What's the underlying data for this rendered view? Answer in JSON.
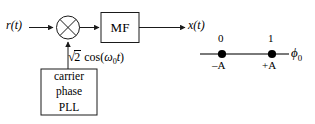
{
  "figure": {
    "type": "block-diagram"
  },
  "block_diagram": {
    "input_signal_label": "r(t)",
    "output_signal_label": "x(t)",
    "multiplier": {
      "symbol": "⊗",
      "name": "multiplier"
    },
    "matched_filter": {
      "label": "MF"
    },
    "local_oscillator": {
      "sqrt_glyph": "√",
      "radicand": "2",
      "expression_tail": "cos(",
      "omega": "ω",
      "omega_subscript": "0",
      "time_var": "t",
      "close_paren": ")",
      "full_text": "√2 cos(ω0t)"
    },
    "pll_block": {
      "line1": "carrier",
      "line2": "phase",
      "line3": "PLL"
    }
  },
  "constellation": {
    "axis_label": "ϕ",
    "axis_subscript": "0",
    "points": [
      {
        "bit": "0",
        "amplitude": "–A"
      },
      {
        "bit": "1",
        "amplitude": "+A"
      }
    ]
  },
  "colors": {
    "stroke": "#1a1a1a",
    "fill_dot": "#000000",
    "background": "#ffffff"
  }
}
